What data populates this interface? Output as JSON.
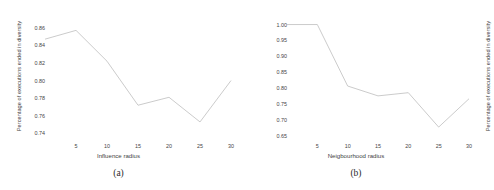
{
  "figure": {
    "panels": [
      {
        "caption": "(a)",
        "chart": {
          "type": "line",
          "title": "",
          "xlabel": "Influence radius",
          "ylabel": "Percentage of executions ended in diversity",
          "x": [
            0,
            5,
            10,
            15,
            20,
            25,
            30
          ],
          "values": [
            0.847,
            0.857,
            0.822,
            0.772,
            0.781,
            0.753,
            0.8
          ],
          "xticks": [
            5,
            10,
            15,
            20,
            25,
            30
          ],
          "yticks": [
            0.74,
            0.76,
            0.78,
            0.8,
            0.82,
            0.84,
            0.86
          ],
          "ytick_labels": [
            "0.74",
            "0.76",
            "0.78",
            "0.80",
            "0.82",
            "0.84",
            "0.86"
          ],
          "xtick_labels": [
            "5",
            "10",
            "15",
            "20",
            "25",
            "30"
          ],
          "xlim": [
            0,
            30
          ],
          "ylim": [
            0.7325,
            0.8665
          ],
          "grid": false,
          "legend": "none",
          "line_color": "#b9b9b9"
        }
      },
      {
        "caption": "(b)",
        "chart": {
          "type": "line",
          "title": "",
          "xlabel": "Neigbourhood radius",
          "ylabel": "Percentage of executions ended in diversity",
          "x": [
            0,
            5,
            10,
            15,
            20,
            25,
            30
          ],
          "values": [
            1.0,
            1.0,
            0.807,
            0.776,
            0.786,
            0.678,
            0.767
          ],
          "xticks": [
            5,
            10,
            15,
            20,
            25,
            30
          ],
          "yticks": [
            0.65,
            0.7,
            0.75,
            0.8,
            0.85,
            0.9,
            0.95,
            1.0
          ],
          "ytick_labels": [
            "0.65",
            "0.70",
            "0.75",
            "0.80",
            "0.85",
            "0.90",
            "0.95",
            "1.00"
          ],
          "xtick_labels": [
            "5",
            "10",
            "15",
            "20",
            "25",
            "30"
          ],
          "xlim": [
            0,
            30
          ],
          "ylim": [
            0.6375,
            1.008
          ],
          "grid": false,
          "legend": "none",
          "line_color": "#b9b9b9"
        }
      }
    ]
  },
  "chart_data": [
    {
      "type": "line",
      "title": "",
      "xlabel": "Influence radius",
      "ylabel": "Percentage of executions ended in diversity",
      "x": [
        0,
        5,
        10,
        15,
        20,
        25,
        30
      ],
      "values": [
        0.847,
        0.857,
        0.822,
        0.772,
        0.781,
        0.753,
        0.8
      ],
      "xlim": [
        0,
        30
      ],
      "ylim": [
        0.7325,
        0.8665
      ],
      "xticks": [
        5,
        10,
        15,
        20,
        25,
        30
      ],
      "yticks": [
        0.74,
        0.76,
        0.78,
        0.8,
        0.82,
        0.84,
        0.86
      ],
      "grid": false,
      "legend": "none",
      "annotations": [
        "(a)"
      ]
    },
    {
      "type": "line",
      "title": "",
      "xlabel": "Neigbourhood radius",
      "ylabel": "Percentage of executions ended in diversity",
      "x": [
        0,
        5,
        10,
        15,
        20,
        25,
        30
      ],
      "values": [
        1.0,
        1.0,
        0.807,
        0.776,
        0.786,
        0.678,
        0.767
      ],
      "xlim": [
        0,
        30
      ],
      "ylim": [
        0.6375,
        1.008
      ],
      "xticks": [
        5,
        10,
        15,
        20,
        25,
        30
      ],
      "yticks": [
        0.65,
        0.7,
        0.75,
        0.8,
        0.85,
        0.9,
        0.95,
        1.0
      ],
      "grid": false,
      "legend": "none",
      "annotations": [
        "(b)"
      ]
    }
  ]
}
